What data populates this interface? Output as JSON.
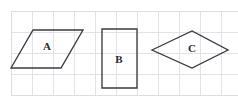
{
  "figure": {
    "background_color": "#ffffff",
    "grid": {
      "line_color": "#e3e1ea",
      "frame_color": "#dedce6",
      "cell_size": 21,
      "origin_x": 11,
      "origin_y": 11,
      "columns": 11,
      "rows": 4,
      "width": 231,
      "height": 84
    },
    "stroke_color": "#3a3a42",
    "label_color": "#2b2b30",
    "shapes": [
      {
        "id": "shape-a",
        "label": "A",
        "type": "parallelogram",
        "points": "11,68 33,30 83,30 61,68",
        "label_x": 47,
        "label_y": 47
      },
      {
        "id": "shape-b",
        "label": "B",
        "type": "rectangle",
        "points": "102,29 137,29 137,88 102,88",
        "label_x": 119,
        "label_y": 60
      },
      {
        "id": "shape-c",
        "label": "C",
        "type": "rhombus",
        "points": "152,50 192,31 228,50 192,68",
        "label_x": 192,
        "label_y": 49
      }
    ]
  }
}
